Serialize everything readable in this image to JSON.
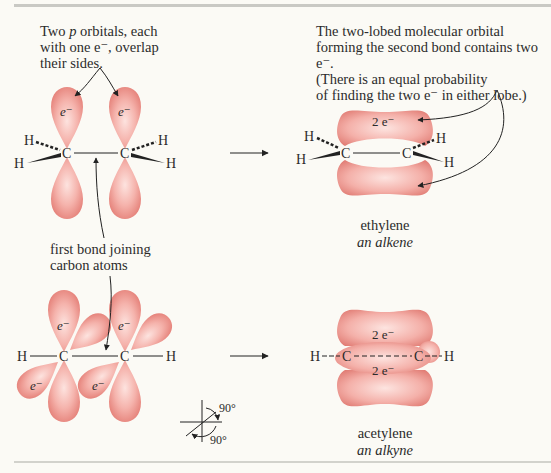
{
  "figure": {
    "colors": {
      "background": "#fbfaf5",
      "orbital_fill": "#f2a9a2",
      "orbital_edge": "#e27f78",
      "orbital_highlight": "#fbe0dc",
      "ink": "#2b2b2b",
      "rule": "#c9c9c4"
    },
    "top_left_caption": {
      "line1_pre": "Two ",
      "line1_italic": "p",
      "line1_post": " orbitals, each",
      "line2": "with one e⁻, overlap",
      "line3": "their sides."
    },
    "top_right_caption": {
      "line1": "The two-lobed molecular orbital",
      "line2": "forming the second bond contains two e⁻.",
      "line3": "(There is an equal probability",
      "line4": "of finding the two e⁻ in either lobe.)"
    },
    "middle_caption": {
      "line1": "first bond joining",
      "line2": "carbon atoms"
    },
    "labels": {
      "electron": "e⁻",
      "two_electrons": "2 e⁻",
      "carbon": "C",
      "hydrogen": "H",
      "angle": "90°"
    },
    "ethylene": {
      "name": "ethylene",
      "class": "an alkene"
    },
    "acetylene": {
      "name": "acetylene",
      "class": "an alkyne"
    },
    "arrows": [
      "reaction-arrow-ethylene",
      "reaction-arrow-acetylene"
    ]
  }
}
